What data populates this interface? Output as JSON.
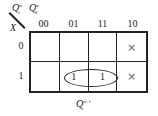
{
  "map": {
    "title_vars": {
      "col_vars": [
        "Q1n",
        "Q0n"
      ],
      "row_var": "X"
    },
    "col_var_label_1": "Q",
    "col_var_label_1_sub": "1",
    "col_var_label_1_sup": "n",
    "col_var_label_2": "Q",
    "col_var_label_2_sub": "0",
    "col_var_label_2_sup": "n",
    "row_var_label": "X",
    "col_headers": [
      "00",
      "01",
      "11",
      "10"
    ],
    "row_headers": [
      "0",
      "1"
    ],
    "cells": [
      [
        "",
        "",
        "",
        "×"
      ],
      [
        "",
        "1",
        "1",
        "×"
      ]
    ],
    "grouping": "Row 1, columns 01 and 11 circled",
    "output_label": "Q",
    "output_sub": "1",
    "output_sup": "n+1"
  }
}
